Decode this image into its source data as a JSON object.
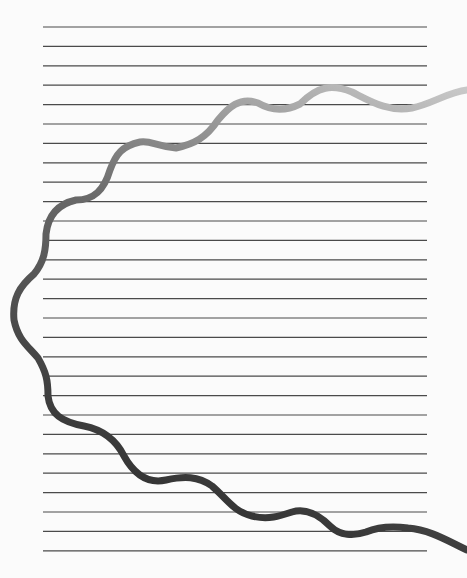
{
  "page": {
    "width": 467,
    "height": 578,
    "background": "#fbfbfb"
  },
  "ruled_lines": {
    "x_start": 43,
    "x_end": 427,
    "y_first": 27,
    "spacing": 19.4,
    "count": 28,
    "color": "#4a4a4a",
    "stroke_width": 1.2
  },
  "wave": {
    "stroke_width": 7,
    "color_start": "#c8c8c8",
    "color_mid": "#6a6a6a",
    "color_end": "#303030",
    "path": "M 467 90 C 448 92, 432 104, 412 108 C 388 112, 372 102, 352 92 C 332 84, 318 86, 300 104 C 284 112, 270 110, 258 103 C 240 96, 228 108, 218 120 C 206 138, 194 144, 176 148 C 156 146, 150 140, 140 142 C 122 146, 116 154, 110 170 C 104 190, 94 200, 76 200 C 58 204, 48 216, 46 234 C 46 250, 44 262, 34 274 C 20 286, 12 298, 14 320 C 18 340, 28 346, 38 358 C 46 372, 48 380, 48 396 C 50 414, 62 422, 84 426 C 104 430, 116 440, 124 456 C 134 474, 148 484, 166 480 C 184 476, 198 476, 212 486 C 226 498, 234 512, 252 516 C 268 520, 280 516, 292 512 C 306 508, 318 514, 330 526 C 340 536, 354 536, 366 532 C 380 526, 394 526, 408 528 C 430 530, 446 540, 467 550"
  }
}
